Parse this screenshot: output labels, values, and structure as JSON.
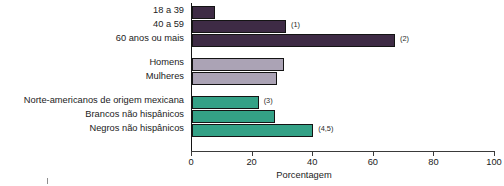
{
  "chart_data": {
    "type": "bar",
    "orientation": "horizontal",
    "title": "",
    "xlabel": "Porcentagem",
    "ylabel": "",
    "xlim": [
      0,
      100
    ],
    "xticks": [
      0,
      20,
      40,
      60,
      80,
      100
    ],
    "grid": false,
    "legend": "none",
    "groups": [
      {
        "name": "Idade",
        "color": "#3e2b45",
        "items": [
          {
            "category": "18 a 39",
            "value": 7.5,
            "footnote": ""
          },
          {
            "category": "40 a 59",
            "value": 31,
            "footnote": "(1)"
          },
          {
            "category": "60 anos ou mais",
            "value": 67,
            "footnote": "(2)"
          }
        ]
      },
      {
        "name": "Sexo",
        "color": "#aba3b5",
        "items": [
          {
            "category": "Homens",
            "value": 30.5,
            "footnote": ""
          },
          {
            "category": "Mulheres",
            "value": 28,
            "footnote": ""
          }
        ]
      },
      {
        "name": "Origem",
        "color": "#34a186",
        "items": [
          {
            "category": "Norte-americanos de origem mexicana",
            "value": 22,
            "footnote": "(3)"
          },
          {
            "category": "Brancos não hispânicos",
            "value": 27.5,
            "footnote": ""
          },
          {
            "category": "Negros não hispânicos",
            "value": 40,
            "footnote": "(4,5)"
          }
        ]
      }
    ],
    "categories": [
      "18 a 39",
      "40 a 59",
      "60 anos ou mais",
      "Homens",
      "Mulheres",
      "Norte-americanos de origem mexicana",
      "Brancos não hispânicos",
      "Negros não hispânicos"
    ],
    "values": [
      7.5,
      31,
      67,
      30.5,
      28,
      22,
      27.5,
      40
    ],
    "footnotes": [
      "",
      "(1)",
      "(2)",
      "",
      "",
      "(3)",
      "",
      "(4,5)"
    ],
    "colors": {
      "age_group": "#3e2b45",
      "sex_group": "#aba3b5",
      "ethnicity_group": "#34a186",
      "axis": "#141414",
      "text": "#1b1b1b",
      "background": "#ffffff"
    }
  }
}
